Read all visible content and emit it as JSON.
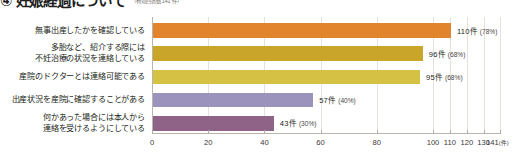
{
  "header": {
    "title": "④ 妊娠経過について",
    "respondents": "（有効回答数 141 件）"
  },
  "chart_data": {
    "type": "bar",
    "orientation": "horizontal",
    "title": "④ 妊娠経過について",
    "xlabel": "件",
    "ylabel": "",
    "xlim": [
      0,
      141
    ],
    "grid": true,
    "legend": "none",
    "total_responses": 141,
    "tick_labels": [
      "0",
      "20",
      "40",
      "60",
      "80",
      "100",
      "110",
      "120",
      "130",
      "141"
    ],
    "tick_values": [
      0,
      20,
      40,
      60,
      80,
      100,
      110,
      120,
      130,
      141
    ],
    "last_tick_unit": "(件)",
    "categories": [
      "無事出産したかを確認している",
      "多胎など、紹介する際には不妊治療の状況を連絡している",
      "産院のドクターとは連絡可能である",
      "出産状況を産院に確認することがある",
      "何かあった場合には本人から連絡を受けるようにしている"
    ],
    "category_lines": [
      [
        "無事出産したかを確認している"
      ],
      [
        "多胎など、紹介する際には",
        "不妊治療の状況を連絡している"
      ],
      [
        "産院のドクターとは連絡可能である"
      ],
      [
        "出産状況を産院に確認することがある"
      ],
      [
        "何かあった場合には本人から",
        "連絡を受けるようにしている"
      ]
    ],
    "values": [
      110,
      96,
      95,
      57,
      43
    ],
    "percents": [
      78,
      68,
      68,
      40,
      30
    ],
    "value_labels": [
      "110件",
      "96件",
      "95件",
      "57件",
      "43件"
    ],
    "percent_labels": [
      "(78%)",
      "(68%)",
      "(68%)",
      "(40%)",
      "(30%)"
    ],
    "colors": [
      "#E2842C",
      "#C9A52A",
      "#D5C144",
      "#9C93BC",
      "#8E6387"
    ]
  }
}
